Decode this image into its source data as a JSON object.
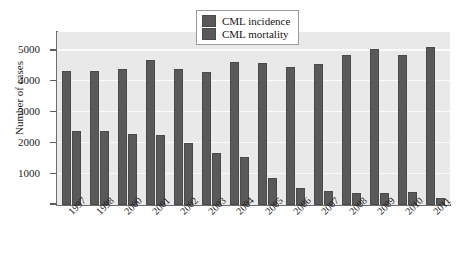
{
  "chart_data": {
    "type": "bar",
    "title": "",
    "xlabel": "",
    "ylabel": "Number of cases",
    "ylim": [
      0,
      5600
    ],
    "yticks": [
      0,
      1000,
      2000,
      3000,
      4000,
      5000
    ],
    "ytick_labels": [
      "0",
      "1000",
      "2000",
      "3000",
      "4000",
      "5000"
    ],
    "grid": true,
    "legend_position": "top-center",
    "categories": [
      "1997",
      "1998",
      "2000",
      "2001",
      "2002",
      "2003",
      "2004",
      "2005",
      "2006",
      "2007",
      "2008",
      "2009",
      "2010",
      "2011"
    ],
    "series": [
      {
        "name": "CML incidence",
        "color": "#595959",
        "values": [
          4330,
          4330,
          4400,
          4700,
          4400,
          4290,
          4620,
          4600,
          4480,
          4570,
          4840,
          5050,
          4860,
          5130
        ]
      },
      {
        "name": "CML mortality",
        "color": "#595959",
        "values": [
          2380,
          2380,
          2290,
          2280,
          2000,
          1680,
          1560,
          860,
          540,
          450,
          400,
          400,
          420,
          230
        ]
      }
    ]
  },
  "legend": {
    "items": [
      {
        "label": "CML incidence"
      },
      {
        "label": "CML mortality"
      }
    ]
  }
}
